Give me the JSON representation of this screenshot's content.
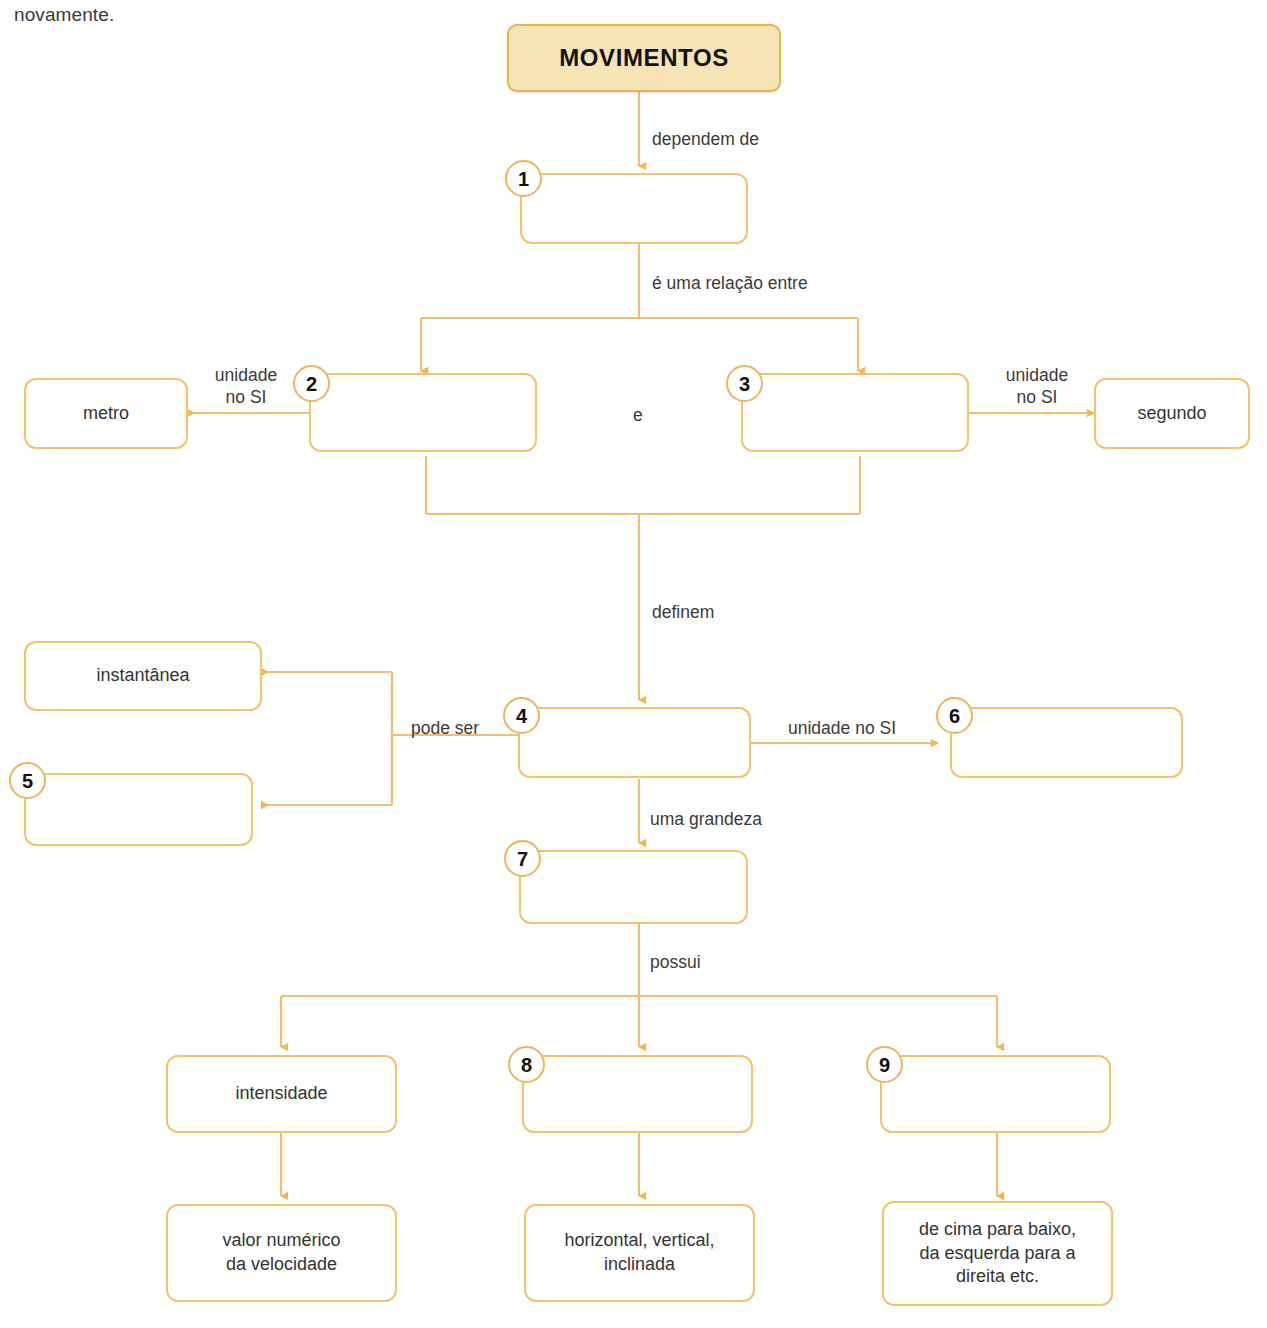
{
  "page": {
    "intro_text": "novamente.",
    "accent_border": "#f2c46a",
    "accent_wire": "#f0c070",
    "title_fill": "#f6e4b6",
    "text_color": "#333333"
  },
  "title_node": {
    "label": "MOVIMENTOS"
  },
  "nodes": [
    {
      "id": "n1",
      "number": "1",
      "label": ""
    },
    {
      "id": "n2",
      "number": "2",
      "label": ""
    },
    {
      "id": "n3",
      "number": "3",
      "label": ""
    },
    {
      "id": "n4",
      "number": "4",
      "label": ""
    },
    {
      "id": "n5",
      "number": "5",
      "label": ""
    },
    {
      "id": "n6",
      "number": "6",
      "label": ""
    },
    {
      "id": "n7",
      "number": "7",
      "label": ""
    },
    {
      "id": "n8",
      "number": "8",
      "label": ""
    },
    {
      "id": "n9",
      "number": "9",
      "label": ""
    }
  ],
  "filled_nodes": {
    "metro": "metro",
    "segundo": "segundo",
    "instantanea": "instantânea",
    "intensidade": "intensidade",
    "valor_numerico": "valor numérico\nda velocidade",
    "horizontal_vertical": "horizontal, vertical,\ninclinada",
    "de_cima": "de cima para baixo,\nda esquerda para a\ndireita etc."
  },
  "edge_labels": {
    "dependem_de": "dependem de",
    "e_uma_relacao_entre": "é uma relação entre",
    "e_conjunction": "e",
    "unidade_no_si_left": "unidade\nno SI",
    "unidade_no_si_right": "unidade\nno SI",
    "definem": "definem",
    "pode_ser": "pode ser",
    "unidade_no_si_6": "unidade no SI",
    "uma_grandeza": "uma grandeza",
    "possui": "possui"
  }
}
